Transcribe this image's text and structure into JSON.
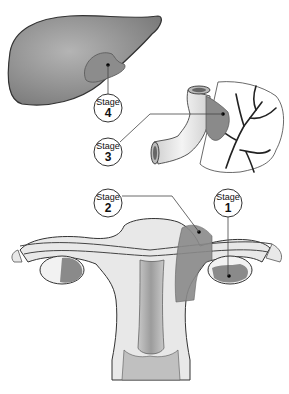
{
  "diagram": {
    "organs": [
      "liver",
      "colon",
      "uterus",
      "ovaries",
      "fallopian-tubes"
    ],
    "colors": {
      "organ_dark": "#8a8a8a",
      "organ_light": "#e6e6e6",
      "tumor": "#7d7d7d",
      "outline": "#333333",
      "callout_line": "#444444"
    },
    "stages": [
      {
        "id": "stage1",
        "label": "Stage",
        "number": "1",
        "location": "right ovary"
      },
      {
        "id": "stage2",
        "label": "Stage",
        "number": "2",
        "location": "uterus / pelvic extension"
      },
      {
        "id": "stage3",
        "label": "Stage",
        "number": "3",
        "location": "colon"
      },
      {
        "id": "stage4",
        "label": "Stage",
        "number": "4",
        "location": "liver"
      }
    ]
  }
}
